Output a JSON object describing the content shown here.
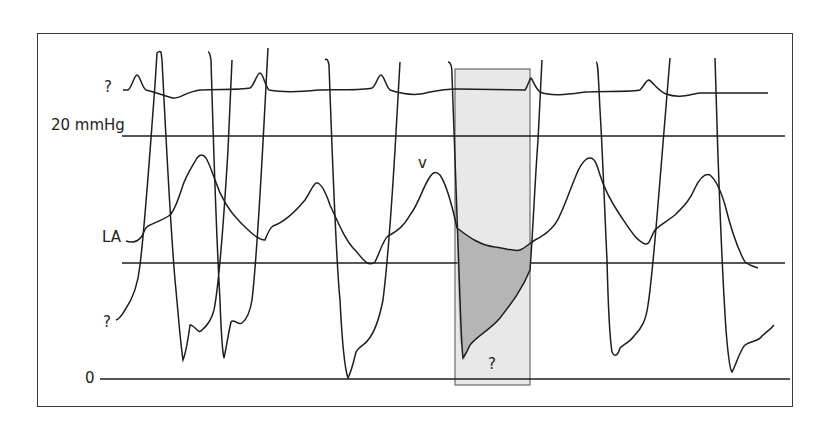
{
  "figure": {
    "type": "pressure tracing diagram",
    "labels": {
      "ecg_trace": "?",
      "scale_20": "20 mmHg",
      "la_trace": "LA",
      "v_wave": "v",
      "lv_trace": "?",
      "zero_line": "0",
      "highlight_label": "?"
    },
    "colors": {
      "trace": "#1e1e1e",
      "frame": "#3a3a3a",
      "highlight_box": "#e6e6e6",
      "gradient_fill": "#b4b4b4"
    },
    "reference_lines_mmHg": [
      0,
      10,
      20
    ]
  }
}
